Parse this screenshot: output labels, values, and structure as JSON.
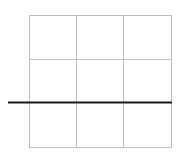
{
  "diagram": {
    "type": "grid",
    "rows": 3,
    "cols": 3,
    "grid_color": "#bdbdbd",
    "line_color": "#1a1a1a",
    "grid_bounds": {
      "x0": 29,
      "y0": 15,
      "x1": 171,
      "y1": 147
    },
    "vertical_lines_x": [
      29,
      76,
      123.5,
      171
    ],
    "horizontal_lines_y": [
      15,
      59,
      103,
      147
    ],
    "highlight_line": {
      "x1": 8,
      "y1": 102.5,
      "x2": 171,
      "y2": 102.5,
      "width": 2
    }
  }
}
